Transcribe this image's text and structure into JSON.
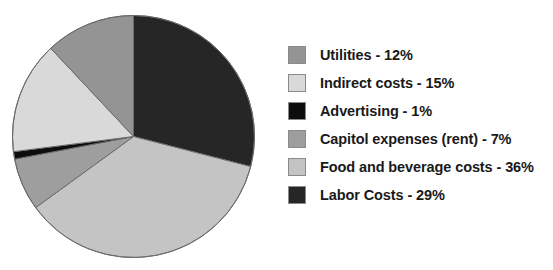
{
  "chart_data": {
    "type": "pie",
    "title": "",
    "subtitle": "",
    "xlabel": "",
    "ylabel": "",
    "grid": false,
    "legend_position": "right",
    "start_angle_deg": 0,
    "direction": "clockwise",
    "units": "percent",
    "total": 100,
    "categories": [
      "Utilities",
      "Indirect costs",
      "Advertising",
      "Capitol expenses (rent)",
      "Food and beverage costs",
      "Labor Costs"
    ],
    "values": [
      12,
      15,
      1,
      7,
      36,
      29
    ],
    "colors": [
      "#949494",
      "#d9d9d9",
      "#0d0d0d",
      "#9e9e9e",
      "#c4c4c4",
      "#262626"
    ],
    "slice_order_clockwise_from_top": [
      "Labor Costs",
      "Food and beverage costs",
      "Capitol expenses (rent)",
      "Advertising",
      "Indirect costs",
      "Utilities"
    ],
    "annotations": []
  },
  "pie": {
    "center_x": 133.5,
    "center_y": 136.5,
    "radius": 121,
    "outline_color": "#6b6b6b",
    "slices": [
      {
        "name": "Labor Costs",
        "value": 29,
        "color": "#262626",
        "start_deg": 0,
        "end_deg": 104.4
      },
      {
        "name": "Food and beverage costs",
        "value": 36,
        "color": "#c4c4c4",
        "start_deg": 104.4,
        "end_deg": 234.0
      },
      {
        "name": "Capitol expenses (rent)",
        "value": 7,
        "color": "#9e9e9e",
        "start_deg": 234.0,
        "end_deg": 259.2
      },
      {
        "name": "Advertising",
        "value": 1,
        "color": "#0d0d0d",
        "start_deg": 259.2,
        "end_deg": 262.8
      },
      {
        "name": "Indirect costs",
        "value": 15,
        "color": "#d9d9d9",
        "start_deg": 262.8,
        "end_deg": 316.8
      },
      {
        "name": "Utilities",
        "value": 12,
        "color": "#949494",
        "start_deg": 316.8,
        "end_deg": 360.0
      }
    ]
  },
  "legend": {
    "items": [
      {
        "label": "Utilities - 12%",
        "color": "#949494",
        "name": "utilities"
      },
      {
        "label": "Indirect costs - 15%",
        "color": "#d9d9d9",
        "name": "indirect-costs"
      },
      {
        "label": "Advertising - 1%",
        "color": "#0d0d0d",
        "name": "advertising"
      },
      {
        "label": "Capitol expenses (rent) - 7%",
        "color": "#9e9e9e",
        "name": "capitol-expenses"
      },
      {
        "label": "Food and beverage costs - 36%",
        "color": "#c4c4c4",
        "name": "food-and-beverage-costs"
      },
      {
        "label": "Labor Costs - 29%",
        "color": "#262626",
        "name": "labor-costs"
      }
    ]
  }
}
